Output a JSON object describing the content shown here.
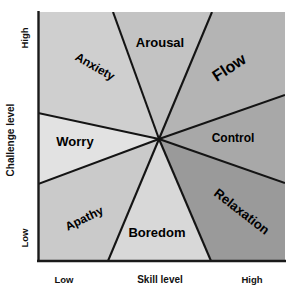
{
  "diagram": {
    "type": "radial-sector-diagram",
    "axes": {
      "y": {
        "title": "Challenge level",
        "low_label": "Low",
        "high_label": "High"
      },
      "x": {
        "title": "Skill level",
        "low_label": "Low",
        "high_label": "High"
      }
    },
    "center": {
      "x": 159,
      "y": 139
    },
    "plot_area": {
      "left": 38,
      "top": 12,
      "right": 285,
      "bottom": 261
    },
    "colors": {
      "worry": "#e2e2e2",
      "anxiety": "#cfcfcf",
      "arousal": "#c3c3c3",
      "flow": "#b4b4b4",
      "control": "#a8a8a8",
      "relaxation": "#9a9a9a",
      "boredom": "#d8d8d8",
      "apathy": "#cacaca",
      "line": "#141414",
      "text": "#000000",
      "background": "#ffffff"
    },
    "sectors": [
      {
        "name": "Arousal",
        "label": "Arousal",
        "rotation": 0,
        "font_size": 13,
        "label_x": 160,
        "label_y": 47,
        "fill": "#c3c3c3"
      },
      {
        "name": "Flow",
        "label": "Flow",
        "rotation": -33,
        "font_size": 16,
        "label_x": 232,
        "label_y": 72,
        "fill": "#b4b4b4"
      },
      {
        "name": "Control",
        "label": "Control",
        "rotation": 0,
        "font_size": 12,
        "label_x": 233,
        "label_y": 142,
        "fill": "#a8a8a8"
      },
      {
        "name": "Relaxation",
        "label": "Relaxation",
        "rotation": 38,
        "font_size": 13,
        "label_x": 239,
        "label_y": 215,
        "fill": "#9a9a9a"
      },
      {
        "name": "Boredom",
        "label": "Boredom",
        "rotation": 0,
        "font_size": 13,
        "label_x": 157,
        "label_y": 237,
        "fill": "#d8d8d8"
      },
      {
        "name": "Apathy",
        "label": "Apathy",
        "rotation": -26,
        "font_size": 12,
        "label_x": 86,
        "label_y": 222,
        "fill": "#cacaca"
      },
      {
        "name": "Worry",
        "label": "Worry",
        "rotation": 0,
        "font_size": 13,
        "label_x": 75,
        "label_y": 146,
        "fill": "#e2e2e2"
      },
      {
        "name": "Anxiety",
        "label": "Anxiety",
        "rotation": 30,
        "font_size": 12,
        "label_x": 93,
        "label_y": 70,
        "fill": "#cfcfcf"
      }
    ]
  }
}
